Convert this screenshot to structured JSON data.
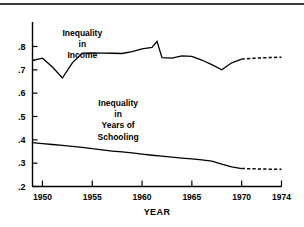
{
  "figure": {
    "has_top_rule": true,
    "background_color": "#ffffff",
    "line_color": "#000000"
  },
  "chart_data": {
    "type": "line",
    "title": "",
    "subtitle": "",
    "xlabel": "YEAR",
    "ylabel": "",
    "xlim": [
      1949,
      1974
    ],
    "ylim": [
      0.2,
      0.85
    ],
    "grid": false,
    "legend_position": "inline-annotation",
    "x_ticks": [
      1950,
      1955,
      1960,
      1965,
      1970,
      1974
    ],
    "x_tick_labels": [
      "1950",
      "1955",
      "1960",
      "1965",
      "1970",
      "1974"
    ],
    "y_ticks": [
      0.2,
      0.3,
      0.4,
      0.5,
      0.6,
      0.7,
      0.8
    ],
    "y_tick_labels": [
      ".2",
      ".3",
      ".4",
      ".5",
      ".6",
      ".7",
      ".8"
    ],
    "annotations": [
      {
        "id": "income-label",
        "text_lines": [
          "Inequality",
          "in",
          "Income"
        ],
        "x": 1954.0,
        "y": 0.845
      },
      {
        "id": "schooling-label",
        "text_lines": [
          "Inequality",
          "in",
          "Years of",
          "Schooling"
        ],
        "x": 1957.6,
        "y": 0.545
      }
    ],
    "series": [
      {
        "name": "Inequality in Income",
        "style": "solid",
        "x": [
          1949,
          1950,
          1951,
          1952,
          1953,
          1954,
          1955,
          1956,
          1957,
          1958,
          1959,
          1960,
          1961,
          1961.5,
          1962,
          1963,
          1964,
          1965,
          1966,
          1967,
          1968,
          1969,
          1970
        ],
        "values": [
          0.74,
          0.75,
          0.712,
          0.665,
          0.73,
          0.772,
          0.773,
          0.772,
          0.771,
          0.77,
          0.778,
          0.79,
          0.796,
          0.822,
          0.752,
          0.75,
          0.76,
          0.758,
          0.742,
          0.722,
          0.7,
          0.73,
          0.746
        ]
      },
      {
        "name": "Inequality in Income (projected)",
        "style": "dashed",
        "x": [
          1970,
          1971,
          1972,
          1973,
          1974
        ],
        "values": [
          0.746,
          0.749,
          0.751,
          0.753,
          0.754
        ]
      },
      {
        "name": "Inequality in Years of Schooling",
        "style": "solid",
        "x": [
          1949,
          1950,
          1951,
          1952,
          1953,
          1954,
          1955,
          1956,
          1957,
          1958,
          1959,
          1960,
          1961,
          1962,
          1963,
          1964,
          1965,
          1966,
          1967,
          1968,
          1969,
          1970
        ],
        "values": [
          0.388,
          0.384,
          0.38,
          0.376,
          0.372,
          0.368,
          0.362,
          0.357,
          0.352,
          0.348,
          0.344,
          0.339,
          0.334,
          0.33,
          0.326,
          0.322,
          0.318,
          0.314,
          0.309,
          0.296,
          0.284,
          0.277
        ]
      },
      {
        "name": "Inequality in Years of Schooling (projected)",
        "style": "dashed",
        "x": [
          1970,
          1971,
          1972,
          1973,
          1974
        ],
        "values": [
          0.277,
          0.276,
          0.275,
          0.274,
          0.274
        ]
      }
    ]
  }
}
